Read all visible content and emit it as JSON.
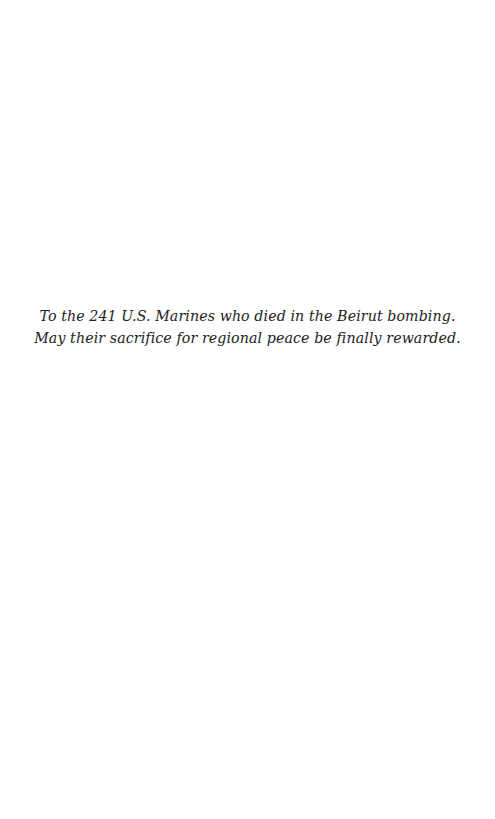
{
  "page": {
    "type": "dedication",
    "background": "#ffffff",
    "text_color": "#222222"
  },
  "dedication": {
    "lines": [
      "To the 241 U.S. Marines who died in the Beirut bombing.",
      "May their sacrifice for regional peace be finally rewarded."
    ]
  }
}
